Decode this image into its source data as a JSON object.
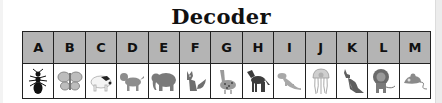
{
  "title": "Decoder",
  "colors": {
    "header_bg": "#b4b4b4",
    "border": "#222222",
    "cell_bg": "#ffffff"
  },
  "columns": [
    {
      "letter": "A",
      "icon": "ant-icon"
    },
    {
      "letter": "B",
      "icon": "butterfly-icon"
    },
    {
      "letter": "C",
      "icon": "cow-icon"
    },
    {
      "letter": "D",
      "icon": "dog-icon"
    },
    {
      "letter": "E",
      "icon": "elephant-icon"
    },
    {
      "letter": "F",
      "icon": "fox-icon"
    },
    {
      "letter": "G",
      "icon": "goose-icon"
    },
    {
      "letter": "H",
      "icon": "horse-icon"
    },
    {
      "letter": "I",
      "icon": "iguana-icon"
    },
    {
      "letter": "J",
      "icon": "jellyfish-icon"
    },
    {
      "letter": "K",
      "icon": "kangaroo-icon"
    },
    {
      "letter": "L",
      "icon": "lion-icon"
    },
    {
      "letter": "M",
      "icon": "mouse-icon"
    }
  ]
}
